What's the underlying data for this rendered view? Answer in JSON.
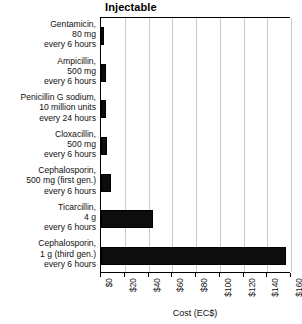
{
  "chart_data": {
    "type": "bar",
    "orientation": "horizontal",
    "title": "Injectable",
    "xlabel": "Cost (EC$)",
    "ylabel": "",
    "xlim": [
      0,
      160
    ],
    "xticks": [
      "$0",
      "$20",
      "$40",
      "$60",
      "$80",
      "$100",
      "$120",
      "$140",
      "$160"
    ],
    "xtick_values": [
      0,
      20,
      40,
      60,
      80,
      100,
      120,
      140,
      160
    ],
    "grid": "vertical",
    "legend": "none",
    "bar_color": "#000000",
    "categories": [
      "Gentamicin,\n80 mg\nevery 6 hours",
      "Ampicillin,\n500 mg\nevery 6 hours",
      "Penicillin G sodium,\n10 million units\nevery 24 hours",
      "Cloxacillin,\n500 mg\nevery 6 hours",
      "Cephalosporin,\n500 mg (first gen.)\nevery 6 hours",
      "Ticarcillin,\n4 g\nevery 6 hours",
      "Cephalosporin,\n1 g (third gen.)\nevery 6 hours"
    ],
    "category_lines": [
      [
        "Gentamicin,",
        "80 mg",
        "every 6 hours"
      ],
      [
        "Ampicillin,",
        "500 mg",
        "every 6 hours"
      ],
      [
        "Penicillin G sodium,",
        "10 million units",
        "every 24 hours"
      ],
      [
        "Cloxacillin,",
        "500 mg",
        "every 6 hours"
      ],
      [
        "Cephalosporin,",
        "500 mg (first gen.)",
        "every 6 hours"
      ],
      [
        "Ticarcillin,",
        "4 g",
        "every 6 hours"
      ],
      [
        "Cephalosporin,",
        "1 g (third gen.)",
        "every 6 hours"
      ]
    ],
    "values": [
      2.5,
      4,
      4,
      5,
      8,
      44,
      156
    ]
  }
}
